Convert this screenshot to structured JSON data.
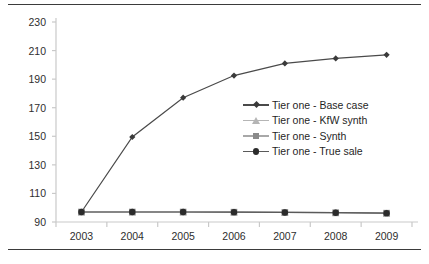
{
  "figure": {
    "rule_color": "#3b3b3b",
    "background": "#ffffff"
  },
  "chart_data": {
    "type": "line",
    "title": "",
    "subtitle": "",
    "xlabel": "",
    "ylabel": "",
    "categories": [
      "2003",
      "2004",
      "2005",
      "2006",
      "2007",
      "2008",
      "2009"
    ],
    "ylim": [
      90,
      230
    ],
    "yticks": [
      90,
      110,
      130,
      150,
      170,
      190,
      210,
      230
    ],
    "ytick_labels": [
      "90",
      "110",
      "130",
      "150",
      "170",
      "190",
      "210",
      "230"
    ],
    "grid": false,
    "legend_position": "center-right inside plot",
    "annotations": [],
    "series": [
      {
        "name": "Tier one - Base case",
        "marker": "diamond",
        "color": "#3a3a3a",
        "line_color": "#4a4a4a",
        "values": [
          97,
          149.5,
          177,
          192.5,
          201,
          204.5,
          207
        ]
      },
      {
        "name": "Tier one - KfW synth",
        "marker": "triangle",
        "color": "#b5b5b5",
        "line_color": "#b5b5b5",
        "values": [
          97,
          97,
          97,
          96.9,
          96.7,
          96.5,
          96.2
        ]
      },
      {
        "name": "Tier one - Synth",
        "marker": "square",
        "color": "#8a8a8a",
        "line_color": "#8a8a8a",
        "values": [
          97,
          97,
          97,
          96.9,
          96.7,
          96.5,
          96.2
        ]
      },
      {
        "name": "Tier one - True sale",
        "marker": "circle",
        "color": "#2b2b2b",
        "line_color": "#5a5a5a",
        "values": [
          97,
          97,
          97,
          96.9,
          96.7,
          96.5,
          96.2
        ]
      }
    ]
  },
  "axis": {
    "axis_color": "#c9c9c9",
    "tick_color": "#c9c9c9",
    "label_color": "#2e2e2e"
  }
}
